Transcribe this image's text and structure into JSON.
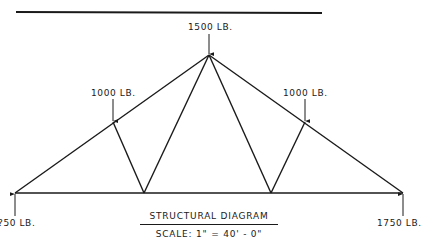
{
  "diagram": {
    "type": "truss",
    "colors": {
      "line": "#1a1a1a",
      "background": "#ffffff"
    },
    "top_rule": {
      "x1": 16,
      "y1": 12,
      "x2": 322,
      "y2": 13
    },
    "nodes": {
      "left_support": [
        15,
        193
      ],
      "right_support": [
        403,
        193
      ],
      "apex": [
        209,
        55
      ],
      "left_upper": [
        113,
        122
      ],
      "right_upper": [
        305,
        122
      ],
      "left_lower": [
        144,
        193
      ],
      "right_lower": [
        271,
        193
      ]
    },
    "loads": [
      {
        "id": "apex",
        "label": "1500 LB.",
        "direction": "down"
      },
      {
        "id": "left_upper",
        "label": "1000 LB.",
        "direction": "down"
      },
      {
        "id": "right_upper",
        "label": "1000 LB.",
        "direction": "down"
      }
    ],
    "reactions": [
      {
        "id": "left_support",
        "label": "?50 LB.",
        "direction": "up"
      },
      {
        "id": "right_support",
        "label": "1750 LB.",
        "direction": "up"
      }
    ],
    "title": "STRUCTURAL DIAGRAM",
    "scale": "SCALE: 1\" = 40' - 0\""
  }
}
